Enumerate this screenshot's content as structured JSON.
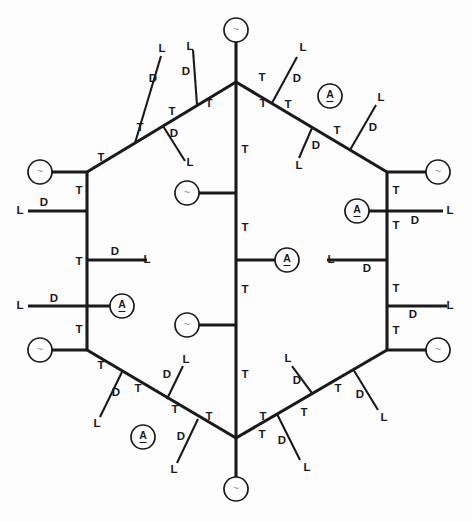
{
  "figure": {
    "background_color": "#fdfdfd",
    "line_color": "#1a1a1a",
    "node_fill": "#ffffff",
    "tilde_color": "#8a8a8a",
    "canvas": {
      "width": 472,
      "height": 521
    }
  },
  "glyphs": {
    "T": "T",
    "D": "D",
    "L": "L",
    "A": "A",
    "tilde": "~"
  },
  "nodes": [
    {
      "id": "n-top",
      "glyph": "~",
      "kind": "tilde",
      "cx": 236,
      "cy": 30,
      "r": 12
    },
    {
      "id": "n-upper-left",
      "glyph": "~",
      "kind": "tilde",
      "cx": 40,
      "cy": 172,
      "r": 12
    },
    {
      "id": "n-upper-right",
      "glyph": "~",
      "kind": "tilde",
      "cx": 438,
      "cy": 172,
      "r": 12
    },
    {
      "id": "n-lower-left",
      "glyph": "~",
      "kind": "tilde",
      "cx": 40,
      "cy": 350,
      "r": 12
    },
    {
      "id": "n-lower-right",
      "glyph": "~",
      "kind": "tilde",
      "cx": 438,
      "cy": 350,
      "r": 12
    },
    {
      "id": "n-bottom",
      "glyph": "~",
      "kind": "tilde",
      "cx": 236,
      "cy": 489,
      "r": 12
    },
    {
      "id": "n-center-upper",
      "glyph": "~",
      "kind": "tilde",
      "cx": 187,
      "cy": 193,
      "r": 12
    },
    {
      "id": "n-center-lower",
      "glyph": "~",
      "kind": "tilde",
      "cx": 187,
      "cy": 325,
      "r": 12
    },
    {
      "id": "n-center-mid-a",
      "glyph": "A",
      "kind": "amine",
      "cx": 287,
      "cy": 260,
      "r": 12
    },
    {
      "id": "n-left-a",
      "glyph": "A",
      "kind": "amine",
      "cx": 122,
      "cy": 306,
      "r": 12
    },
    {
      "id": "n-right-a",
      "glyph": "A",
      "kind": "amine",
      "cx": 357,
      "cy": 211,
      "r": 12
    },
    {
      "id": "n-top-right-a",
      "glyph": "A",
      "kind": "amine",
      "cx": 330,
      "cy": 96,
      "r": 12
    },
    {
      "id": "n-bottom-left-a",
      "glyph": "A",
      "kind": "amine",
      "cx": 143,
      "cy": 437,
      "r": 12
    }
  ],
  "backbone": {
    "description": "Hexagon outline with a central vertical spine",
    "segments": [
      {
        "id": "edge-top-left",
        "x1": 87,
        "y1": 172,
        "x2": 236,
        "y2": 82
      },
      {
        "id": "edge-top-right",
        "x1": 236,
        "y1": 82,
        "x2": 387,
        "y2": 172
      },
      {
        "id": "edge-left",
        "x1": 87,
        "y1": 172,
        "x2": 87,
        "y2": 350
      },
      {
        "id": "edge-right",
        "x1": 387,
        "y1": 172,
        "x2": 387,
        "y2": 350
      },
      {
        "id": "edge-bottom-left",
        "x1": 87,
        "y1": 350,
        "x2": 236,
        "y2": 438
      },
      {
        "id": "edge-bottom-right",
        "x1": 236,
        "y1": 438,
        "x2": 387,
        "y2": 350
      },
      {
        "id": "spine-center",
        "x1": 236,
        "y1": 82,
        "x2": 236,
        "y2": 438
      },
      {
        "id": "stem-top",
        "x1": 236,
        "y1": 42,
        "x2": 236,
        "y2": 82
      },
      {
        "id": "stem-bottom",
        "x1": 236,
        "y1": 438,
        "x2": 236,
        "y2": 477
      }
    ]
  },
  "branches": [
    {
      "id": "b-tl-1",
      "x1": 135,
      "y1": 143,
      "x2": 161,
      "y2": 56,
      "label_d": {
        "x": 153,
        "y": 79
      },
      "label_l": {
        "x": 162,
        "y": 49
      },
      "label_t": {
        "x": 101,
        "y": 158
      }
    },
    {
      "id": "b-tl-2",
      "x1": 163,
      "y1": 126,
      "x2": 185,
      "y2": 161,
      "label_d": {
        "x": 174,
        "y": 134
      },
      "label_l": {
        "x": 190,
        "y": 163
      },
      "label_t": {
        "x": 140,
        "y": 128
      }
    },
    {
      "id": "b-tl-3",
      "x1": 197,
      "y1": 105,
      "x2": 193,
      "y2": 50,
      "label_d": {
        "x": 186,
        "y": 72
      },
      "label_l": {
        "x": 190,
        "y": 47
      },
      "label_t": {
        "x": 172,
        "y": 112
      }
    },
    {
      "id": "b-tr-1",
      "x1": 272,
      "y1": 103,
      "x2": 297,
      "y2": 57,
      "label_d": {
        "x": 297,
        "y": 79
      },
      "label_l": {
        "x": 303,
        "y": 48
      },
      "label_t": {
        "x": 262,
        "y": 78
      }
    },
    {
      "id": "b-tr-2",
      "x1": 312,
      "y1": 128,
      "x2": 299,
      "y2": 158,
      "label_d": {
        "x": 316,
        "y": 146
      },
      "label_l": {
        "x": 299,
        "y": 166
      },
      "label_t": {
        "x": 288,
        "y": 105
      }
    },
    {
      "id": "b-tr-3",
      "x1": 350,
      "y1": 150,
      "x2": 376,
      "y2": 105,
      "label_d": {
        "x": 373,
        "y": 128
      },
      "label_l": {
        "x": 381,
        "y": 98
      },
      "label_t": {
        "x": 337,
        "y": 131
      }
    },
    {
      "id": "b-bl-1",
      "x1": 122,
      "y1": 372,
      "x2": 100,
      "y2": 417,
      "label_d": {
        "x": 116,
        "y": 393
      },
      "label_l": {
        "x": 97,
        "y": 424
      },
      "label_t": {
        "x": 101,
        "y": 366
      }
    },
    {
      "id": "b-bl-2",
      "x1": 167,
      "y1": 399,
      "x2": 183,
      "y2": 366,
      "label_d": {
        "x": 167,
        "y": 375
      },
      "label_l": {
        "x": 186,
        "y": 360
      },
      "label_t": {
        "x": 138,
        "y": 389
      }
    },
    {
      "id": "b-bl-3",
      "x1": 198,
      "y1": 419,
      "x2": 177,
      "y2": 463,
      "label_d": {
        "x": 181,
        "y": 437
      },
      "label_l": {
        "x": 174,
        "y": 470
      },
      "label_t": {
        "x": 175,
        "y": 410
      }
    },
    {
      "id": "b-br-1",
      "x1": 277,
      "y1": 414,
      "x2": 300,
      "y2": 460,
      "label_d": {
        "x": 282,
        "y": 441
      },
      "label_l": {
        "x": 307,
        "y": 468
      },
      "label_t": {
        "x": 262,
        "y": 435
      }
    },
    {
      "id": "b-br-2",
      "x1": 312,
      "y1": 393,
      "x2": 292,
      "y2": 366,
      "label_d": {
        "x": 297,
        "y": 381
      },
      "label_l": {
        "x": 288,
        "y": 359
      },
      "label_t": {
        "x": 304,
        "y": 413
      }
    },
    {
      "id": "b-br-3",
      "x1": 353,
      "y1": 369,
      "x2": 378,
      "y2": 410,
      "label_d": {
        "x": 360,
        "y": 395
      },
      "label_l": {
        "x": 384,
        "y": 418
      },
      "label_t": {
        "x": 338,
        "y": 389
      }
    }
  ],
  "connectors": [
    {
      "id": "c-ul-tilde",
      "x1": 52,
      "y1": 172,
      "x2": 87,
      "y2": 172,
      "label_t": {
        "x": 79,
        "y": 191
      }
    },
    {
      "id": "c-ul-dl",
      "x1": 28,
      "y1": 211,
      "x2": 87,
      "y2": 211,
      "label_d": {
        "x": 44,
        "y": 203
      },
      "label_l": {
        "x": 20,
        "y": 211
      }
    },
    {
      "id": "c-l-dl",
      "x1": 87,
      "y1": 260,
      "x2": 147,
      "y2": 260,
      "label_d": {
        "x": 115,
        "y": 252
      },
      "label_l": {
        "x": 147,
        "y": 260
      },
      "label_t": {
        "x": 79,
        "y": 262
      }
    },
    {
      "id": "c-l-a",
      "x1": 28,
      "y1": 306,
      "x2": 110,
      "y2": 306,
      "label_d": {
        "x": 54,
        "y": 299
      },
      "label_l": {
        "x": 20,
        "y": 306
      }
    },
    {
      "id": "c-ll-tilde",
      "x1": 52,
      "y1": 350,
      "x2": 87,
      "y2": 350,
      "label_t": {
        "x": 79,
        "y": 330
      }
    },
    {
      "id": "c-ur-tilde",
      "x1": 387,
      "y1": 172,
      "x2": 426,
      "y2": 172,
      "label_t": {
        "x": 396,
        "y": 191
      }
    },
    {
      "id": "c-ur-a-l",
      "x1": 369,
      "y1": 211,
      "x2": 443,
      "y2": 211,
      "label_d": {
        "x": 415,
        "y": 221
      },
      "label_l": {
        "x": 450,
        "y": 211
      },
      "label_t": {
        "x": 396,
        "y": 226
      }
    },
    {
      "id": "c-r-dl",
      "x1": 327,
      "y1": 260,
      "x2": 387,
      "y2": 260,
      "label_d": {
        "x": 367,
        "y": 269
      },
      "label_l": {
        "x": 331,
        "y": 260
      }
    },
    {
      "id": "c-r-dl2",
      "x1": 387,
      "y1": 306,
      "x2": 447,
      "y2": 306,
      "label_d": {
        "x": 413,
        "y": 315
      },
      "label_l": {
        "x": 450,
        "y": 306
      },
      "label_t": {
        "x": 396,
        "y": 289
      }
    },
    {
      "id": "c-lr-tilde",
      "x1": 387,
      "y1": 350,
      "x2": 426,
      "y2": 350,
      "label_t": {
        "x": 396,
        "y": 331
      }
    },
    {
      "id": "c-center-up",
      "x1": 199,
      "y1": 193,
      "x2": 236,
      "y2": 193,
      "label_t": {
        "x": 245,
        "y": 228
      }
    },
    {
      "id": "c-center-a",
      "x1": 236,
      "y1": 260,
      "x2": 275,
      "y2": 260
    },
    {
      "id": "c-center-lo",
      "x1": 199,
      "y1": 325,
      "x2": 236,
      "y2": 325,
      "label_t": {
        "x": 245,
        "y": 290
      }
    }
  ],
  "axis_labels": {
    "spine_upper_t": {
      "text": "T",
      "x": 245,
      "y": 150
    },
    "spine_lower_t": {
      "text": "T",
      "x": 245,
      "y": 375
    },
    "apex_left_t": {
      "text": "T",
      "x": 209,
      "y": 104
    },
    "apex_right_t": {
      "text": "T",
      "x": 263,
      "y": 104
    },
    "base_left_t": {
      "text": "T",
      "x": 209,
      "y": 417
    },
    "base_right_t": {
      "text": "T",
      "x": 263,
      "y": 417
    }
  },
  "legend": {
    "tilde_meaning": "~",
    "amine_meaning": "A",
    "terminal_meaning": "L",
    "branch_meaning": "D",
    "backbone_meaning": "T"
  }
}
